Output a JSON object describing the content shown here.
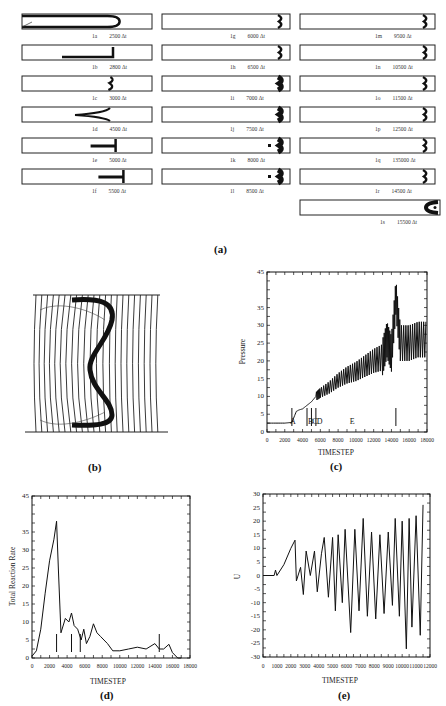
{
  "figure": {
    "panel_a": {
      "label": "(a)",
      "tubes": [
        {
          "id": "1a",
          "time": "2500 Δt"
        },
        {
          "id": "1b",
          "time": "2800 Δt"
        },
        {
          "id": "1c",
          "time": "3000 Δt"
        },
        {
          "id": "1d",
          "time": "4500 Δt"
        },
        {
          "id": "1e",
          "time": "5000 Δt"
        },
        {
          "id": "1f",
          "time": "5500 Δt"
        },
        {
          "id": "1g",
          "time": "6000 Δt"
        },
        {
          "id": "1h",
          "time": "6500 Δt"
        },
        {
          "id": "1i",
          "time": "7000 Δt"
        },
        {
          "id": "1j",
          "time": "7500 Δt"
        },
        {
          "id": "1k",
          "time": "8000 Δt"
        },
        {
          "id": "1l",
          "time": "8500 Δt"
        },
        {
          "id": "1m",
          "time": "9500 Δt"
        },
        {
          "id": "1n",
          "time": "10500 Δt"
        },
        {
          "id": "1o",
          "time": "11500 Δt"
        },
        {
          "id": "1p",
          "time": "12500 Δt"
        },
        {
          "id": "1q",
          "time": "135000 Δt"
        },
        {
          "id": "1r",
          "time": "14500 Δt"
        },
        {
          "id": "1s",
          "time": "15500 Δt"
        }
      ]
    },
    "panel_b": {
      "label": "(b)"
    },
    "panel_c": {
      "label": "(c)"
    },
    "panel_d": {
      "label": "(d)"
    },
    "panel_e": {
      "label": "(e)"
    }
  },
  "chart_data": [
    {
      "id": "c",
      "type": "line",
      "title": "",
      "xlabel": "TIMESTEP",
      "ylabel": "Pressure",
      "xlim": [
        0,
        18000
      ],
      "ylim": [
        0,
        45
      ],
      "x_ticks": [
        "0",
        "2000",
        "4000",
        "6000",
        "8000",
        "10000",
        "12000",
        "14000",
        "16000",
        "18000"
      ],
      "y_ticks": [
        "0",
        "5",
        "10",
        "15",
        "20",
        "25",
        "30",
        "35",
        "45"
      ],
      "annotations": [
        "A",
        "B",
        "C",
        "D",
        "E"
      ],
      "marker_lines_x": [
        2800,
        4500,
        5000,
        5500,
        14500
      ],
      "x": [
        0,
        2000,
        2800,
        3300,
        3600,
        4000,
        4500,
        5000,
        5500,
        6000,
        7000,
        8000,
        9000,
        10000,
        11000,
        12000,
        13000,
        13500,
        14000,
        14500,
        15000,
        16000,
        17000,
        18000
      ],
      "values": [
        2.5,
        2.5,
        2.7,
        5.8,
        6.2,
        6.5,
        7.5,
        8.5,
        10,
        11,
        12.5,
        14.5,
        16,
        17,
        18.5,
        20,
        21,
        26,
        22,
        38,
        25,
        25,
        26,
        26
      ],
      "grid": false
    },
    {
      "id": "d",
      "type": "line",
      "title": "",
      "xlabel": "TIMESTEP",
      "ylabel": "Total Reaction Rate",
      "xlim": [
        0,
        18000
      ],
      "ylim": [
        0,
        45
      ],
      "x_ticks": [
        "0",
        "2000",
        "4000",
        "6000",
        "8000",
        "10000",
        "12000",
        "14000",
        "16000",
        "18000"
      ],
      "y_ticks": [
        "0",
        "5",
        "10",
        "15",
        "20",
        "25",
        "30",
        "35",
        "45"
      ],
      "marker_lines_x": [
        2800,
        4500,
        5500,
        14500
      ],
      "x": [
        0,
        500,
        1000,
        1500,
        2000,
        2500,
        2800,
        3000,
        3300,
        3800,
        4200,
        4500,
        4800,
        5200,
        5600,
        5900,
        6200,
        6600,
        7000,
        7400,
        7800,
        8200,
        8600,
        9200,
        10000,
        11000,
        12000,
        13000,
        14000,
        14500,
        15000,
        15600,
        16000,
        16600,
        17000
      ],
      "values": [
        0.5,
        2,
        8,
        18,
        27,
        33,
        38,
        25,
        7,
        11,
        10,
        12.5,
        9,
        8,
        5,
        8,
        4,
        6,
        9.5,
        7,
        6,
        5,
        4,
        2,
        2,
        2.5,
        3,
        2.5,
        4,
        2.5,
        2.5,
        3.8,
        1.5,
        0,
        0
      ],
      "grid": false
    },
    {
      "id": "e",
      "type": "line",
      "title": "",
      "xlabel": "TIMESTEP",
      "ylabel": "U",
      "xlim": [
        0,
        12000
      ],
      "ylim": [
        -30,
        30
      ],
      "x_ticks": [
        "0",
        "1000",
        "2000",
        "3000",
        "4000",
        "5000",
        "6000",
        "7000",
        "8000",
        "9000",
        "10000",
        "11000",
        "12000"
      ],
      "y_ticks": [
        "30",
        "25",
        "20",
        "15",
        "10",
        "5",
        "0",
        "-5",
        "-10",
        "-15",
        "-20",
        "-25",
        "-30"
      ],
      "x": [
        0,
        800,
        900,
        1000,
        1500,
        2000,
        2300,
        2400,
        2700,
        2900,
        3100,
        3400,
        3700,
        3900,
        4200,
        4400,
        4700,
        5000,
        5200,
        5400,
        5700,
        5900,
        6300,
        6600,
        6900,
        7200,
        7500,
        7800,
        8100,
        8400,
        8700,
        9000,
        9300,
        9500,
        9800,
        10000,
        10300,
        10500,
        10700,
        11000,
        11300,
        11500
      ],
      "values": [
        0,
        0,
        2,
        0,
        4,
        10,
        13,
        -2,
        3,
        -7,
        9,
        0,
        9,
        -6,
        8,
        14,
        -8,
        14,
        -13,
        15,
        -10,
        17,
        -21,
        17,
        -13,
        21,
        -15,
        16,
        -16,
        15,
        -14,
        16,
        -11,
        21,
        -15,
        20,
        -27,
        21,
        -19,
        22,
        -22,
        26
      ],
      "grid": false
    }
  ]
}
